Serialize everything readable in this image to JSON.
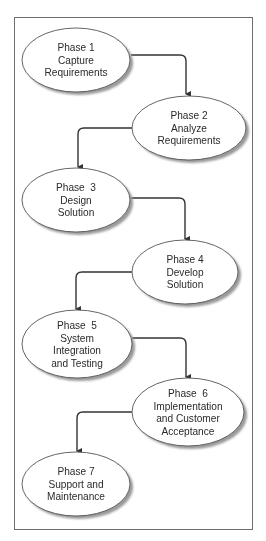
{
  "diagram": {
    "type": "flowchart",
    "frame": {
      "x": 14,
      "y": 17,
      "width": 238,
      "height": 512,
      "stroke": "#6e6e6e"
    },
    "colors": {
      "ellipse_fill": "#ffffff",
      "ellipse_stroke": "#555555",
      "shadow": "#9a9a9a",
      "connector": "#333333",
      "text": "#2a2a2a"
    },
    "nodes": [
      {
        "id": "phase-1",
        "lines": [
          "Phase 1",
          "Capture",
          "Requirements"
        ],
        "cx": 76,
        "cy": 60,
        "rx": 54,
        "ry": 32
      },
      {
        "id": "phase-2",
        "lines": [
          "Phase 2",
          "Analyze",
          "Requirements"
        ],
        "cx": 189,
        "cy": 128,
        "rx": 57,
        "ry": 32
      },
      {
        "id": "phase-3",
        "lines": [
          "Phase  3",
          "Design",
          "Solution"
        ],
        "cx": 76,
        "cy": 200,
        "rx": 54,
        "ry": 32
      },
      {
        "id": "phase-4",
        "lines": [
          "Phase 4",
          "Develop",
          "Solution"
        ],
        "cx": 185,
        "cy": 272,
        "rx": 53,
        "ry": 32
      },
      {
        "id": "phase-5",
        "lines": [
          "Phase  5",
          "System",
          "Integration",
          "and Testing"
        ],
        "cx": 77,
        "cy": 344,
        "rx": 55,
        "ry": 34
      },
      {
        "id": "phase-6",
        "lines": [
          "Phase  6",
          "Implementation",
          "and Customer",
          "Acceptance"
        ],
        "cx": 188,
        "cy": 412,
        "rx": 56,
        "ry": 34
      },
      {
        "id": "phase-7",
        "lines": [
          "Phase 7",
          "Support and",
          "Maintenance"
        ],
        "cx": 76,
        "cy": 484,
        "rx": 54,
        "ry": 32
      }
    ],
    "edges": [
      {
        "from": "phase-1",
        "to": "phase-2",
        "x1": 131,
        "y1": 55,
        "xc": 186,
        "y2": 95
      },
      {
        "from": "phase-2",
        "to": "phase-3",
        "x1": 132,
        "y1": 128,
        "xc": 78,
        "y2": 168
      },
      {
        "from": "phase-3",
        "to": "phase-4",
        "x1": 131,
        "y1": 198,
        "xc": 185,
        "y2": 240
      },
      {
        "from": "phase-4",
        "to": "phase-5",
        "x1": 132,
        "y1": 272,
        "xc": 76,
        "y2": 310
      },
      {
        "from": "phase-5",
        "to": "phase-6",
        "x1": 132,
        "y1": 338,
        "xc": 186,
        "y2": 378
      },
      {
        "from": "phase-6",
        "to": "phase-7",
        "x1": 132,
        "y1": 412,
        "xc": 77,
        "y2": 452
      }
    ]
  }
}
